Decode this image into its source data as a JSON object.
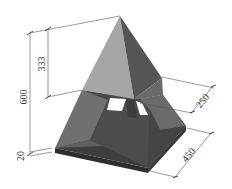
{
  "diagram": {
    "dimensions": {
      "total_height": "600",
      "upper_height": "333",
      "base_thickness": "20",
      "mid_width": "250",
      "base_width": "450"
    },
    "colors": {
      "upper_left_face": "#a6a6a6",
      "upper_right_face": "#555555",
      "lower_left_face": "#6e6e6e",
      "lower_right_face": "#6a6a6a",
      "inner_back": "#4a4a4a",
      "base_top": "#3e3e3e",
      "base_front": "#2e2e2e",
      "opening": "#ffffff",
      "dimension_line": "#555555",
      "dimension_text": "#333333"
    }
  }
}
